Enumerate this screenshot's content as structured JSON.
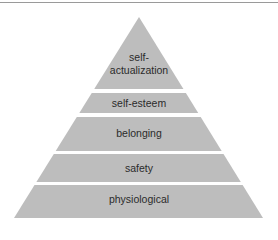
{
  "diagram": {
    "type": "pyramid",
    "fill_color": "#bdbdbd",
    "levels": [
      {
        "label": "self-\nactualization",
        "line1": "self-",
        "line2": "actualization"
      },
      {
        "label": "self-esteem"
      },
      {
        "label": "belonging"
      },
      {
        "label": "safety"
      },
      {
        "label": "physiological"
      }
    ]
  }
}
